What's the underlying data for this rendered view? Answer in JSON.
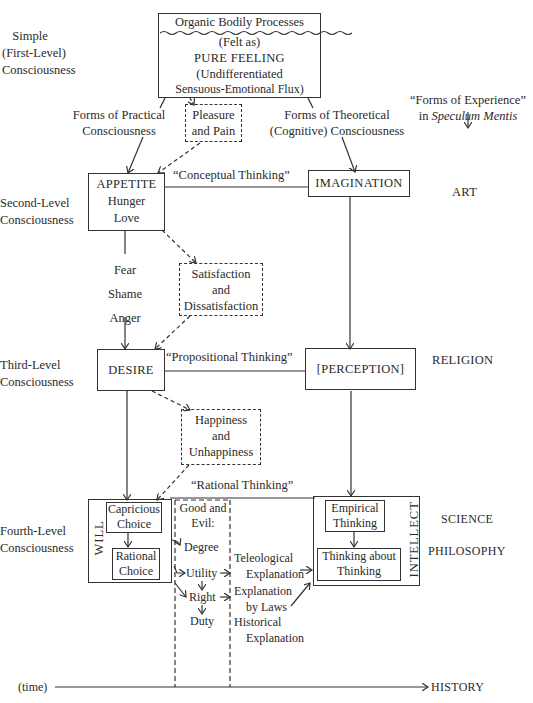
{
  "levels": {
    "first": [
      "Simple",
      "(First-Level)",
      "Consciousness"
    ],
    "second": [
      "Second-Level",
      "Consciousness"
    ],
    "third": [
      "Third-Level",
      "Consciousness"
    ],
    "fourth": [
      "Fourth-Level",
      "Consciousness"
    ]
  },
  "top_box": {
    "header": "Organic Bodily Processes",
    "line1": "(Felt as)",
    "line2": "PURE FEELING",
    "line3": "(Undifferentiated",
    "line4": "Sensuous-Emotional Flux)"
  },
  "practical_label": [
    "Forms of Practical",
    "Consciousness"
  ],
  "theoretical_label": [
    "Forms of Theoretical",
    "(Cognitive) Consciousness"
  ],
  "pleasure_box": [
    "Pleasure",
    "and Pain"
  ],
  "forms_of_experience": {
    "line1": "“Forms of Experience”",
    "line2_prefix": "in ",
    "line2_italic": "Speculum Mentis",
    "arrow": "↓"
  },
  "appetite_box": [
    "APPETITE",
    "Hunger",
    "Love"
  ],
  "conceptual_thinking": "“Conceptual Thinking”",
  "imagination_box": "IMAGINATION",
  "art": "ART",
  "emotions": [
    "Fear",
    "Shame",
    "Anger"
  ],
  "satisfaction_box": [
    "Satisfaction",
    "and",
    "Dissatisfaction"
  ],
  "desire_box": "DESIRE",
  "propositional_thinking": "“Propositional Thinking”",
  "perception_box": "[PERCEPTION]",
  "religion": "RELIGION",
  "happiness_box": [
    "Happiness",
    "and",
    "Unhappiness"
  ],
  "rational_thinking": "“Rational Thinking”",
  "will": {
    "label": "WILL",
    "capricious": [
      "Capricious",
      "Choice"
    ],
    "rational": [
      "Rational",
      "Choice"
    ]
  },
  "good_evil": {
    "header": [
      "Good and",
      "Evil:"
    ],
    "items": [
      "Degree",
      "Utility",
      "Right",
      "Duty"
    ]
  },
  "explanations": {
    "teleological": [
      "Teleological",
      "Explanation"
    ],
    "laws": [
      "Explanation",
      "by Laws"
    ],
    "historical": [
      "Historical",
      "Explanation"
    ]
  },
  "intellect": {
    "label": "INTELLECT",
    "empirical": [
      "Empirical",
      "Thinking"
    ],
    "thinking_about": [
      "Thinking about",
      "Thinking"
    ]
  },
  "science": "SCIENCE",
  "philosophy": "PHILOSOPHY",
  "timeline": {
    "start": "(time)",
    "end": "HISTORY"
  }
}
